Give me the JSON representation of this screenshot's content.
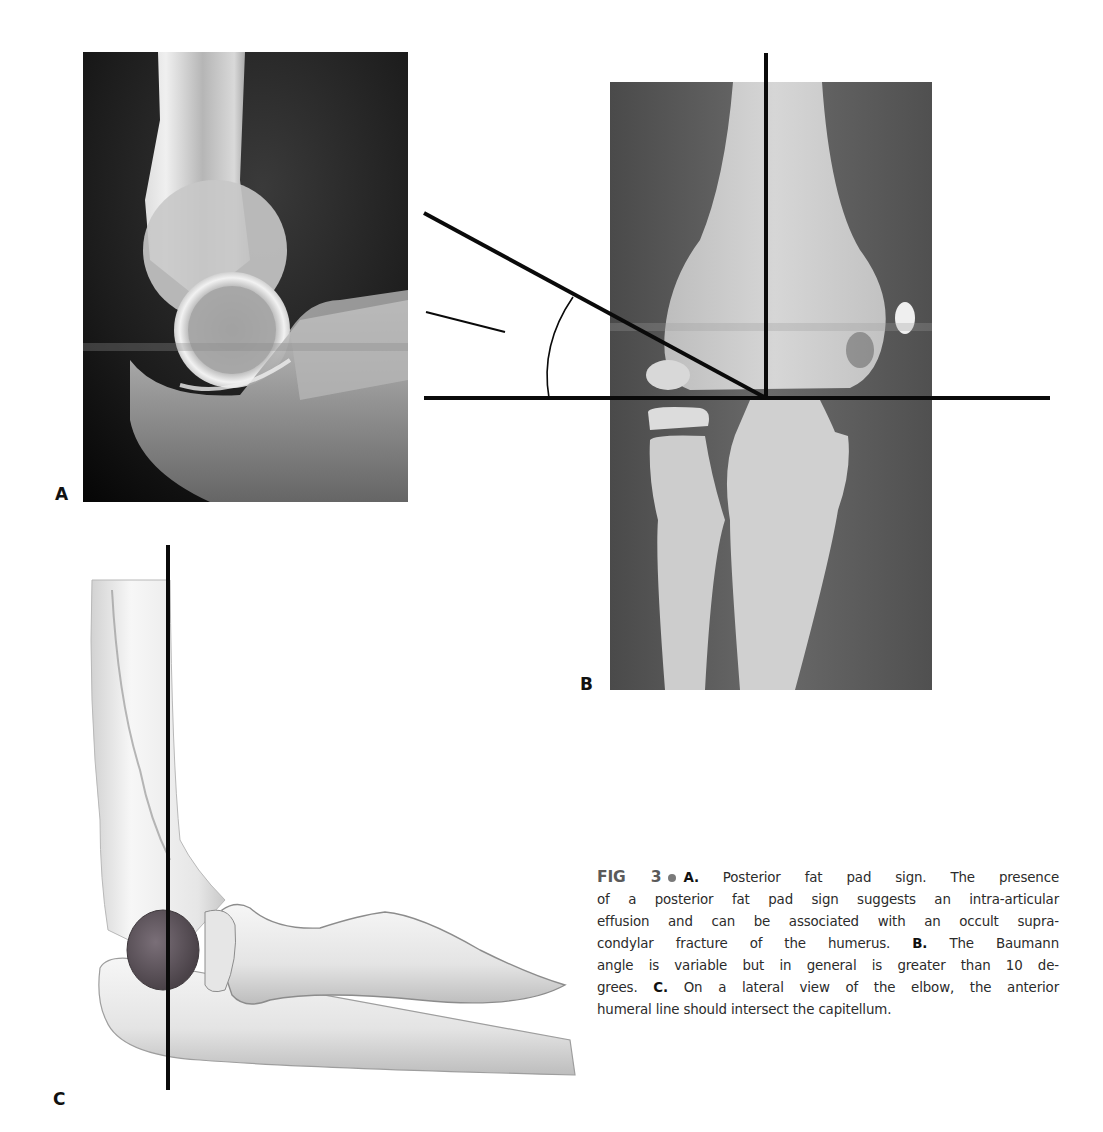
{
  "figure": {
    "number_label": "FIG 3",
    "panels": [
      {
        "id": "A",
        "label": "A",
        "type": "radiograph",
        "view": "lateral elbow radiograph"
      },
      {
        "id": "B",
        "label": "B",
        "type": "radiograph",
        "view": "anteroposterior elbow radiograph with Baumann angle lines"
      },
      {
        "id": "C",
        "label": "C",
        "type": "illustration",
        "view": "lateral elbow illustration with anterior humeral line"
      }
    ],
    "caption": {
      "lines": [
        {
          "parts": [
            {
              "k": "A.",
              "t": " Posterior fat pad sign. The presence"
            }
          ]
        },
        {
          "parts": [
            {
              "t": "of a posterior fat pad sign suggests an intra-articular"
            }
          ]
        },
        {
          "parts": [
            {
              "t": "effusion and can be associated with an occult supra-"
            }
          ]
        },
        {
          "parts": [
            {
              "t": "condylar fracture of the humerus. "
            },
            {
              "k": "B.",
              "t": " The Baumann"
            }
          ]
        },
        {
          "parts": [
            {
              "t": "angle is variable but in general is greater than 10 de-"
            }
          ]
        },
        {
          "parts": [
            {
              "t": "grees. "
            },
            {
              "k": "C.",
              "t": " On a lateral view of the elbow, the anterior"
            }
          ]
        },
        {
          "parts": [
            {
              "t": "humeral line should intersect the capitellum."
            }
          ]
        }
      ],
      "text": "A. Posterior fat pad sign. The presence of a posterior fat pad sign suggests an intra-articular effusion and can be associated with an occult supracondylar fracture of the humerus. B. The Baumann angle is variable but in general is greater than 10 degrees. C. On a lateral view of the elbow, the anterior humeral line should intersect the capitellum."
    },
    "colors": {
      "line": "#0a0a0a",
      "xray_bg_a": "#141414",
      "xray_bg_b": "#5c5c5c",
      "bone": "#d9d9d9",
      "capitellum": "#5e5560",
      "caption_text": "#2b2b2b",
      "fig_label": "#5a5a5a"
    }
  }
}
